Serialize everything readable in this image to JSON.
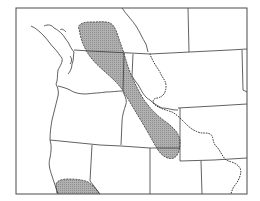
{
  "map": {
    "type": "species range map",
    "region": "Northwestern United States",
    "colors": {
      "background": "#ffffff",
      "range_fill": "#a9a9a9",
      "borders": "#3a3a3a",
      "frame": "#4a4a4a"
    },
    "features": {
      "range_areas": [
        "northern-rockies-range",
        "sierra-nevada-range"
      ],
      "lines": [
        "state-borders",
        "canada-border",
        "pacific-coastline",
        "continental-divide-dotted"
      ]
    }
  }
}
